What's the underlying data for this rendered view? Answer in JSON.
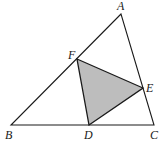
{
  "diagram": {
    "title": "",
    "shaded_fill": "#bdbdbd",
    "stroke_color": "#1a1a1a",
    "points": {
      "A": {
        "label": "A",
        "x": 121,
        "y": 14,
        "lx": 117,
        "ly": 10
      },
      "B": {
        "label": "B",
        "x": 11,
        "y": 125,
        "lx": 5,
        "ly": 139
      },
      "C": {
        "label": "C",
        "x": 154,
        "y": 125,
        "lx": 150,
        "ly": 139
      },
      "D": {
        "label": "D",
        "x": 89,
        "y": 125,
        "lx": 84,
        "ly": 139
      },
      "E": {
        "label": "E",
        "x": 143,
        "y": 88,
        "lx": 146,
        "ly": 92
      },
      "F": {
        "label": "F",
        "x": 77,
        "y": 59,
        "lx": 68,
        "ly": 59
      }
    },
    "outer_triangle": [
      "A",
      "B",
      "C"
    ],
    "inner_triangle": [
      "D",
      "E",
      "F"
    ]
  }
}
